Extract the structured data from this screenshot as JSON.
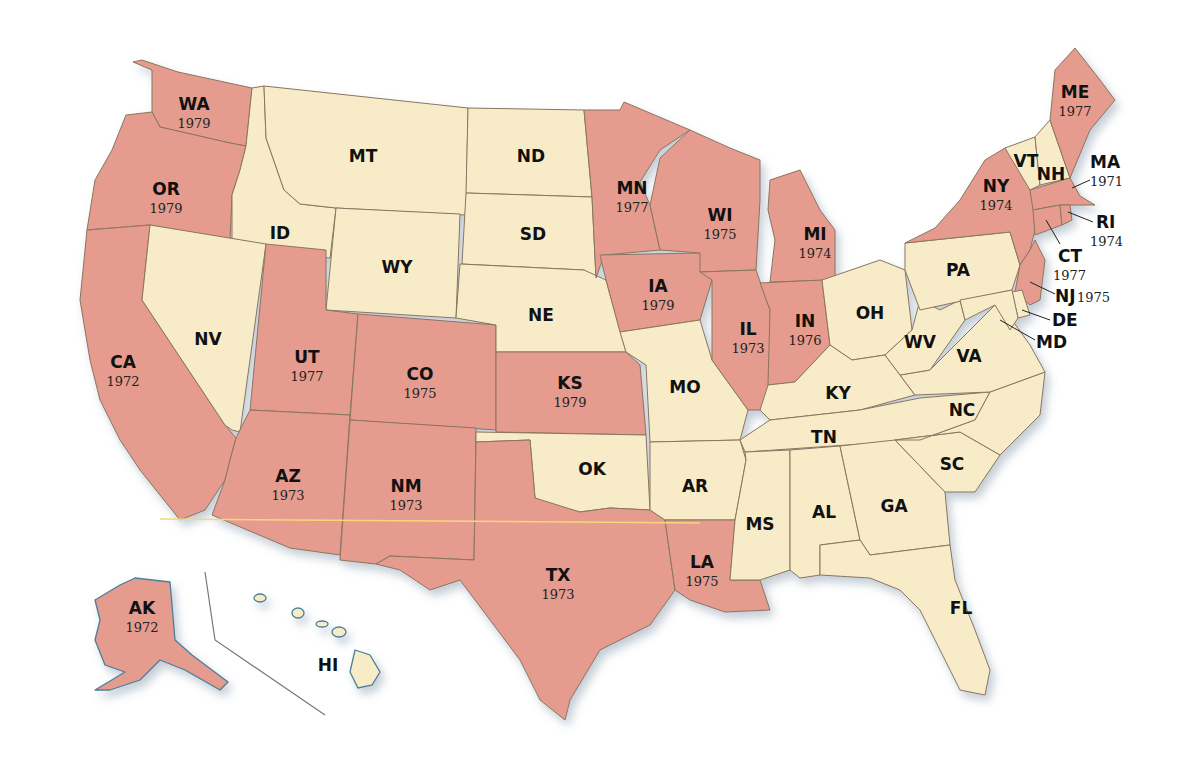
{
  "map": {
    "type": "choropleth",
    "subject": "United States map with selected states labeled by year",
    "colors": {
      "with_year": "#e59b8e",
      "without_year": "#f8ecc8",
      "border": "#8a7560",
      "coast": "#4a7f9a",
      "background": "#ffffff"
    },
    "states": {
      "WA": {
        "abbr": "WA",
        "year": "1979"
      },
      "OR": {
        "abbr": "OR",
        "year": "1979"
      },
      "CA": {
        "abbr": "CA",
        "year": "1972"
      },
      "ID": {
        "abbr": "ID"
      },
      "NV": {
        "abbr": "NV"
      },
      "MT": {
        "abbr": "MT"
      },
      "WY": {
        "abbr": "WY"
      },
      "UT": {
        "abbr": "UT",
        "year": "1977"
      },
      "CO": {
        "abbr": "CO",
        "year": "1975"
      },
      "AZ": {
        "abbr": "AZ",
        "year": "1973"
      },
      "NM": {
        "abbr": "NM",
        "year": "1973"
      },
      "ND": {
        "abbr": "ND"
      },
      "SD": {
        "abbr": "SD"
      },
      "NE": {
        "abbr": "NE"
      },
      "KS": {
        "abbr": "KS",
        "year": "1979"
      },
      "OK": {
        "abbr": "OK"
      },
      "TX": {
        "abbr": "TX",
        "year": "1973"
      },
      "MN": {
        "abbr": "MN",
        "year": "1977"
      },
      "IA": {
        "abbr": "IA",
        "year": "1979"
      },
      "MO": {
        "abbr": "MO"
      },
      "AR": {
        "abbr": "AR"
      },
      "LA": {
        "abbr": "LA",
        "year": "1975"
      },
      "WI": {
        "abbr": "WI",
        "year": "1975"
      },
      "IL": {
        "abbr": "IL",
        "year": "1973"
      },
      "MI": {
        "abbr": "MI",
        "year": "1974"
      },
      "IN": {
        "abbr": "IN",
        "year": "1976"
      },
      "OH": {
        "abbr": "OH"
      },
      "KY": {
        "abbr": "KY"
      },
      "TN": {
        "abbr": "TN"
      },
      "MS": {
        "abbr": "MS"
      },
      "AL": {
        "abbr": "AL"
      },
      "GA": {
        "abbr": "GA"
      },
      "FL": {
        "abbr": "FL"
      },
      "SC": {
        "abbr": "SC"
      },
      "NC": {
        "abbr": "NC"
      },
      "VA": {
        "abbr": "VA"
      },
      "WV": {
        "abbr": "WV"
      },
      "PA": {
        "abbr": "PA"
      },
      "NY": {
        "abbr": "NY",
        "year": "1974"
      },
      "VT": {
        "abbr": "VT"
      },
      "NH": {
        "abbr": "NH"
      },
      "ME": {
        "abbr": "ME",
        "year": "1977"
      },
      "MA": {
        "abbr": "MA",
        "year": "1971"
      },
      "RI": {
        "abbr": "RI",
        "year": "1974"
      },
      "CT": {
        "abbr": "CT",
        "year": "1977"
      },
      "NJ": {
        "abbr": "NJ",
        "year": "1975"
      },
      "DE": {
        "abbr": "DE"
      },
      "MD": {
        "abbr": "MD"
      },
      "AK": {
        "abbr": "AK",
        "year": "1972"
      },
      "HI": {
        "abbr": "HI"
      }
    }
  }
}
